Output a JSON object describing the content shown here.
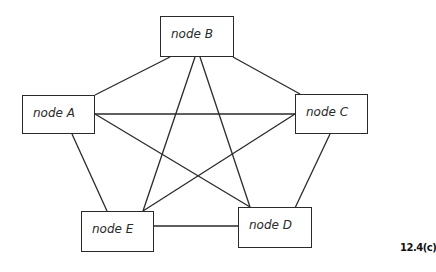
{
  "diagram": {
    "type": "complete-graph",
    "figure_label": "12.4(c)",
    "nodes": [
      {
        "id": "A",
        "label": "node A"
      },
      {
        "id": "B",
        "label": "node B"
      },
      {
        "id": "C",
        "label": "node C"
      },
      {
        "id": "D",
        "label": "node D"
      },
      {
        "id": "E",
        "label": "node E"
      }
    ],
    "edges": [
      [
        "B",
        "A"
      ],
      [
        "B",
        "C"
      ],
      [
        "B",
        "E"
      ],
      [
        "B",
        "D"
      ],
      [
        "A",
        "C"
      ],
      [
        "A",
        "D"
      ],
      [
        "A",
        "E"
      ],
      [
        "C",
        "E"
      ],
      [
        "C",
        "D"
      ],
      [
        "E",
        "D"
      ]
    ]
  }
}
